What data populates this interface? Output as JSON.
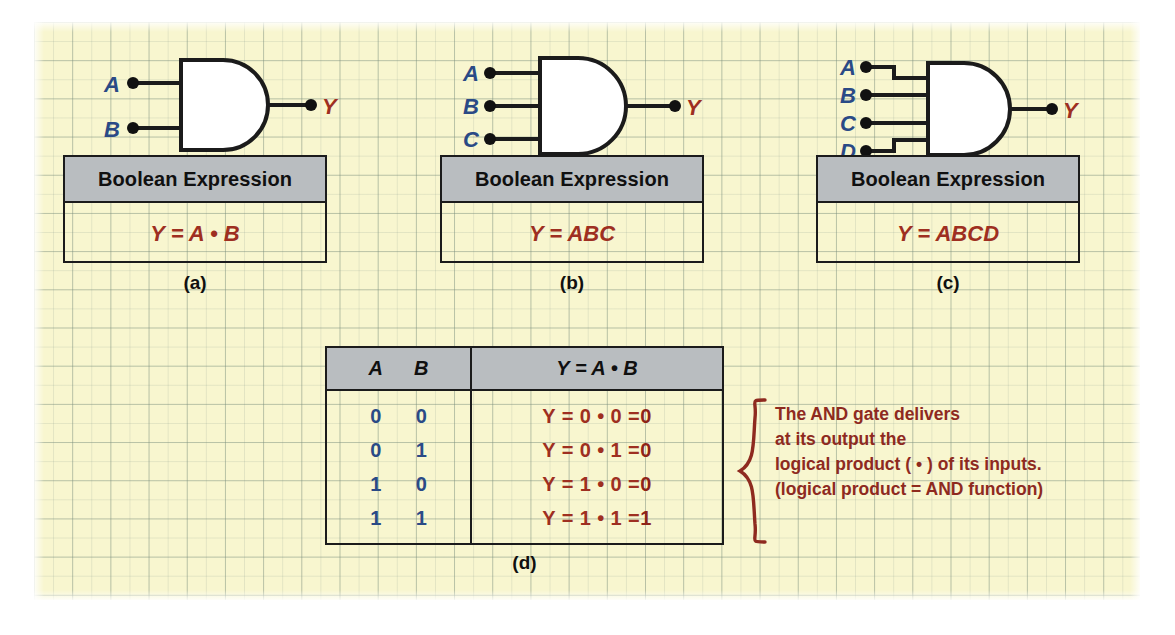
{
  "figure": {
    "background_color": "#f8f6cf",
    "grid_color": "#8fa08f",
    "label_blue": "#2a4a86",
    "label_red": "#9e2f21",
    "header_gray": "#b9bdc0",
    "line_black": "#1b1b1b"
  },
  "panels": [
    {
      "id": "a",
      "label": "(a)",
      "gate": "AND",
      "inputs": [
        "A",
        "B"
      ],
      "output": "Y",
      "box_header": "Boolean Expression",
      "expression": "Y = A • B"
    },
    {
      "id": "b",
      "label": "(b)",
      "gate": "AND",
      "inputs": [
        "A",
        "B",
        "C"
      ],
      "output": "Y",
      "box_header": "Boolean Expression",
      "expression": "Y = ABC"
    },
    {
      "id": "c",
      "label": "(c)",
      "gate": "AND",
      "inputs": [
        "A",
        "B",
        "C",
        "D"
      ],
      "output": "Y",
      "box_header": "Boolean Expression",
      "expression": "Y = ABCD"
    }
  ],
  "truth_table": {
    "label": "(d)",
    "headers": {
      "a": "A",
      "b": "B",
      "y": "Y = A • B"
    },
    "rows": [
      {
        "a": "0",
        "b": "0",
        "expr_prefix": "Y = 0 • 0 = ",
        "result": "0"
      },
      {
        "a": "0",
        "b": "1",
        "expr_prefix": "Y = 0 • 1 = ",
        "result": "0"
      },
      {
        "a": "1",
        "b": "0",
        "expr_prefix": "Y = 1 • 0 = ",
        "result": "0"
      },
      {
        "a": "1",
        "b": "1",
        "expr_prefix": "Y = 1 • 1 = ",
        "result": "1"
      }
    ]
  },
  "annotation": {
    "line1": "The AND gate delivers",
    "line2": "at its output the",
    "line3": "logical product ( • ) of its inputs.",
    "line4": "(logical product = AND function)"
  }
}
